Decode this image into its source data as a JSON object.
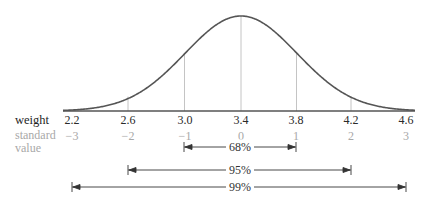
{
  "chart_data": {
    "type": "normal-distribution",
    "mean": 3.4,
    "sd": 0.4,
    "x_axis": {
      "row_labels": {
        "weight": "weight",
        "standard": "standard",
        "value": "value"
      },
      "weight_ticks": [
        "2.2",
        "2.6",
        "3.0",
        "3.4",
        "3.8",
        "4.2",
        "4.6"
      ],
      "standard_ticks": [
        "−3",
        "−2",
        "−1",
        "0",
        "1",
        "2",
        "3"
      ]
    },
    "intervals": [
      {
        "label": "68%",
        "from_sd": -1,
        "to_sd": 1
      },
      {
        "label": "95%",
        "from_sd": -2,
        "to_sd": 2
      },
      {
        "label": "99%",
        "from_sd": -3,
        "to_sd": 3
      }
    ],
    "colors": {
      "curve": "#555555",
      "axis": "#555555",
      "gridline": "#b5b5b5",
      "standard_text": "#a8a8a8"
    }
  }
}
